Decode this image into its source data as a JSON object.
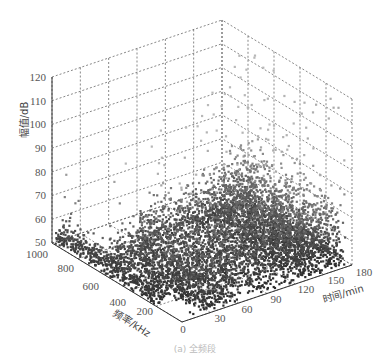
{
  "chart_data": {
    "type": "scatter",
    "projection": "3d",
    "title": "",
    "caption": "(a) 全频段",
    "xlabel": "时间/min",
    "ylabel": "频率/kHz",
    "zlabel": "幅值/dB",
    "x_ticks": [
      0,
      30,
      60,
      90,
      120,
      150,
      180
    ],
    "y_ticks": [
      200,
      400,
      600,
      800,
      1000
    ],
    "z_ticks": [
      50,
      60,
      70,
      80,
      90,
      100,
      110,
      120
    ],
    "xlim": [
      0,
      180
    ],
    "ylim": [
      0,
      1000
    ],
    "zlim": [
      50,
      120
    ],
    "grid": true,
    "colormap": "grayscale (dark = low amplitude, light = high amplitude)",
    "series": [
      {
        "name": "partial discharge pulses",
        "description": "Dense vertical columns of points distributed over time 0-175 min and frequency 0-1000 kHz; most amplitudes 50-85 dB, sparse outliers up to ~115 dB, densest near 30-60 min and 150-170 min",
        "clusters": [
          {
            "time_range": [
              0,
              15
            ],
            "freq_range": [
              200,
              1000
            ],
            "amp_range": [
              50,
              70
            ]
          },
          {
            "time_range": [
              15,
              60
            ],
            "freq_range": [
              0,
              700
            ],
            "amp_range": [
              50,
              90
            ]
          },
          {
            "time_range": [
              60,
              120
            ],
            "freq_range": [
              0,
              800
            ],
            "amp_range": [
              50,
              95
            ]
          },
          {
            "time_range": [
              120,
              150
            ],
            "freq_range": [
              0,
              800
            ],
            "amp_range": [
              50,
              100
            ]
          },
          {
            "time_range": [
              150,
              175
            ],
            "freq_range": [
              0,
              800
            ],
            "amp_range": [
              50,
              115
            ]
          }
        ]
      }
    ]
  },
  "axes": {
    "z_tick_labels": [
      "120",
      "110",
      "100",
      "90",
      "80",
      "70",
      "60",
      "50"
    ],
    "y_tick_labels": [
      "1000",
      "800",
      "600",
      "400",
      "200",
      "0"
    ],
    "x_tick_labels": [
      "30",
      "60",
      "90",
      "120",
      "150",
      "180"
    ],
    "zlabel": "幅值/dB",
    "ylabel": "频率/kHz",
    "xlabel": "时间/min",
    "caption": "(a) 全频段"
  }
}
